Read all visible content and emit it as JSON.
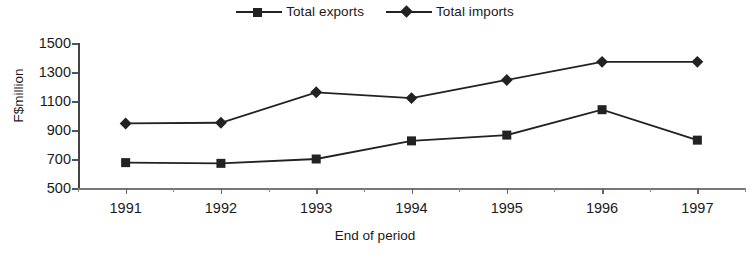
{
  "chart_data": {
    "type": "line",
    "title": "",
    "xlabel": "End of period",
    "ylabel": "F$million",
    "categories": [
      "1991",
      "1992",
      "1993",
      "1994",
      "1995",
      "1996",
      "1997"
    ],
    "series": [
      {
        "name": "Total exports",
        "marker": "square",
        "color": "#222222",
        "values": [
          675,
          670,
          700,
          825,
          865,
          1040,
          830
        ]
      },
      {
        "name": "Total imports",
        "marker": "diamond",
        "color": "#222222",
        "values": [
          945,
          950,
          1160,
          1120,
          1245,
          1370,
          1370
        ]
      }
    ],
    "ylim": [
      500,
      1500
    ],
    "ytick_step": 200,
    "yticks": [
      500,
      700,
      900,
      1100,
      1300,
      1500
    ],
    "ytick_labels": [
      "500",
      "700",
      "900",
      "1100",
      "1300",
      "1500"
    ],
    "grid": false,
    "legend_position": "top-center"
  },
  "legend": {
    "entries": [
      {
        "label": "Total exports",
        "marker": "square-marker-icon"
      },
      {
        "label": "Total imports",
        "marker": "diamond-marker-icon"
      }
    ]
  },
  "axes": {
    "y_title": "F$million",
    "x_title": "End of period"
  }
}
